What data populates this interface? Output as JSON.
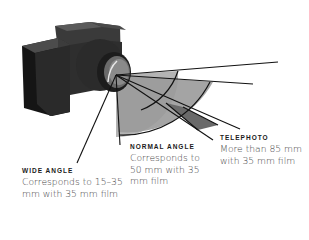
{
  "figure": {
    "colors": {
      "camera_dark": "#1e1e1e",
      "camera_mid": "#3a3a3a",
      "camera_light": "#5a5a5a",
      "wide_fill": "#a8a8a8",
      "normal_fill": "#8a8a8a",
      "tele_fill": "#6e6e6e",
      "line": "#111111"
    }
  },
  "labels": {
    "wide": {
      "title": "WIDE ANGLE",
      "desc_line1": "Corresponds to 15–35",
      "desc_line2": "mm with 35 mm film"
    },
    "normal": {
      "title": "NORMAL ANGLE",
      "desc_line1": "Corresponds to",
      "desc_line2": "50 mm with 35",
      "desc_line3": "mm film"
    },
    "telephoto": {
      "title": "TELEPHOTO",
      "desc_line1": "More than 85 mm",
      "desc_line2": "with 35 mm film"
    }
  }
}
